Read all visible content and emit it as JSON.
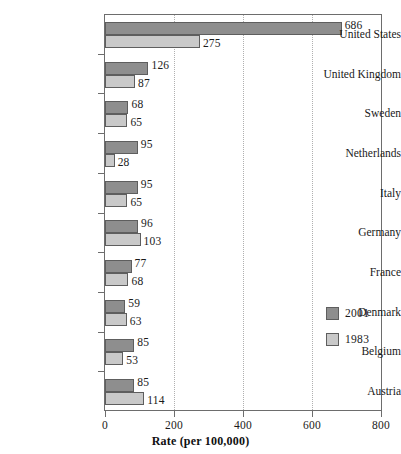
{
  "chart_data": {
    "type": "bar",
    "orientation": "horizontal",
    "title": "",
    "xlabel": "Rate (per 100,000)",
    "ylabel": "",
    "xlim": [
      0,
      800
    ],
    "xticks": [
      0,
      200,
      400,
      600,
      800
    ],
    "xtick_labels": [
      "0",
      "200",
      "400",
      "600",
      "800"
    ],
    "grid": "vertical-dotted-at-200-400-600",
    "legend_position": "inside-right-lower",
    "categories": [
      "United States",
      "United Kingdom",
      "Sweden",
      "Netherlands",
      "Italy",
      "Germany",
      "France",
      "Denmark",
      "Belgium",
      "Austria"
    ],
    "series": [
      {
        "name": "2001",
        "color": "#8e8e8e",
        "values": [
          686,
          126,
          68,
          95,
          95,
          96,
          77,
          59,
          85,
          85
        ]
      },
      {
        "name": "1983",
        "color": "#c9c9c9",
        "values": [
          275,
          87,
          65,
          28,
          65,
          103,
          68,
          63,
          53,
          114
        ]
      }
    ]
  },
  "axis": {
    "x_title": "Rate (per 100,000)",
    "ticks": [
      {
        "value": 0,
        "label": "0"
      },
      {
        "value": 200,
        "label": "200"
      },
      {
        "value": 400,
        "label": "400"
      },
      {
        "value": 600,
        "label": "600"
      },
      {
        "value": 800,
        "label": "800"
      }
    ]
  },
  "legend": {
    "items": [
      {
        "label": "2001",
        "swatch": "recent"
      },
      {
        "label": "1983",
        "swatch": "older"
      }
    ]
  },
  "colors": {
    "series_recent": "#8e8e8e",
    "series_older": "#c9c9c9",
    "bar_outline": "#5e5e5e",
    "frame": "#6d6d6d",
    "gridline": "#b0b0b0",
    "text": "#1a1a1a",
    "background": "#ffffff"
  }
}
